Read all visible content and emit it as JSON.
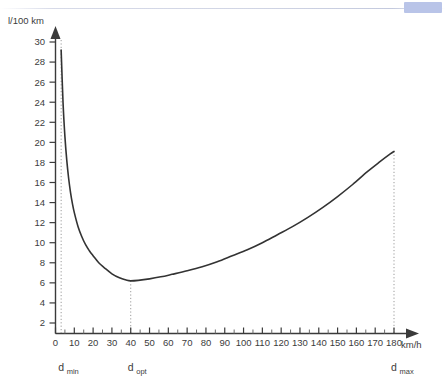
{
  "page": {
    "background_color": "#ffffff",
    "corner_badge_color": "#b9c4e8",
    "rule_color": "#c4cade"
  },
  "chart_data": {
    "type": "line",
    "title": "",
    "xlabel": "km/h",
    "ylabel": "l/100 km",
    "xlim": [
      0,
      190
    ],
    "ylim": [
      0,
      31
    ],
    "grid": false,
    "legend": "none",
    "line_color": "#333333",
    "x_ticks": [
      0,
      10,
      20,
      30,
      40,
      50,
      60,
      70,
      80,
      90,
      100,
      110,
      120,
      130,
      140,
      150,
      160,
      170,
      180
    ],
    "y_ticks": [
      2,
      4,
      6,
      8,
      10,
      12,
      14,
      16,
      18,
      20,
      22,
      24,
      26,
      28,
      30
    ],
    "x": [
      3,
      4,
      5,
      6,
      7,
      8,
      9,
      10,
      12,
      14,
      16,
      18,
      20,
      23,
      26,
      30,
      34,
      38,
      40,
      44,
      50,
      56,
      62,
      70,
      78,
      86,
      94,
      102,
      110,
      118,
      126,
      134,
      142,
      150,
      158,
      166,
      172,
      178,
      180
    ],
    "y": [
      29.2,
      24.0,
      20.6,
      18.2,
      16.4,
      15.0,
      13.9,
      13.0,
      11.6,
      10.6,
      9.8,
      9.2,
      8.7,
      8.0,
      7.5,
      6.9,
      6.5,
      6.25,
      6.2,
      6.25,
      6.4,
      6.6,
      6.85,
      7.2,
      7.6,
      8.1,
      8.7,
      9.3,
      10.0,
      10.8,
      11.6,
      12.5,
      13.5,
      14.6,
      15.8,
      17.1,
      18.0,
      18.85,
      19.1
    ],
    "annotations": [
      {
        "name": "d_min",
        "label": "d",
        "subscript": "min",
        "x": 3,
        "value_line": "dotted"
      },
      {
        "name": "d_opt",
        "label": "d",
        "subscript": "opt",
        "x": 40,
        "value_line": "dotted"
      },
      {
        "name": "d_max",
        "label": "d",
        "subscript": "max",
        "x": 180,
        "value_line": "dotted"
      }
    ],
    "minimum": {
      "x": 40,
      "y": 6.2
    }
  }
}
